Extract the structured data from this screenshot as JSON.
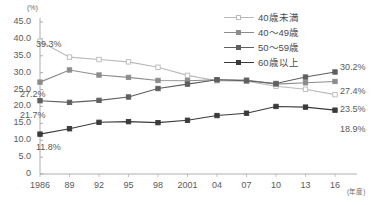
{
  "chart_data": {
    "type": "line",
    "title": "",
    "subtitle": "",
    "xlabel": "(年度)",
    "ylabel": "(%)",
    "x": [
      1986,
      1989,
      1992,
      1995,
      1998,
      2001,
      2004,
      2007,
      2010,
      2013,
      2016
    ],
    "categories": [
      "1986",
      "89",
      "92",
      "95",
      "98",
      "2001",
      "04",
      "07",
      "10",
      "13",
      "16"
    ],
    "ylim": [
      0,
      45
    ],
    "yticks": [
      0,
      5,
      10,
      15,
      20,
      25,
      30,
      35,
      40,
      45
    ],
    "ytick_labels": [
      "0",
      "5.0",
      "10.0",
      "15.0",
      "20.0",
      "25.0",
      "30.0",
      "35.0",
      "40.0",
      "45.0"
    ],
    "grid": false,
    "legend_position": "top-right",
    "series": [
      {
        "name": "40歳未満",
        "color": "#b9b9b9",
        "marker": "open-square",
        "values": [
          39.3,
          34.6,
          33.9,
          33.2,
          31.6,
          29.2,
          27.6,
          27.5,
          26.0,
          25.1,
          23.5
        ],
        "start_label": "39.3%",
        "end_label": "23.5%"
      },
      {
        "name": "40～49歳",
        "color": "#8c8c8c",
        "marker": "filled-square",
        "values": [
          27.2,
          30.8,
          29.3,
          28.6,
          27.7,
          27.6,
          27.9,
          27.8,
          26.6,
          27.0,
          27.4
        ],
        "start_label": "27.2%",
        "end_label": "27.4%"
      },
      {
        "name": "50～59歳",
        "color": "#5f5f5f",
        "marker": "filled-square",
        "values": [
          21.7,
          21.2,
          21.8,
          22.8,
          25.3,
          26.6,
          27.9,
          27.6,
          26.8,
          28.7,
          30.2
        ],
        "start_label": "21.7%",
        "end_label": "30.2%"
      },
      {
        "name": "60歳以上",
        "color": "#3a3a3a",
        "marker": "filled-square",
        "values": [
          11.8,
          13.4,
          15.3,
          15.5,
          15.2,
          15.9,
          17.3,
          18.0,
          20.0,
          19.8,
          18.9
        ],
        "start_label": "11.8%",
        "end_label": "18.9%"
      }
    ],
    "point_labels": [
      {
        "text": "39.3%",
        "x": 36,
        "y": 39
      },
      {
        "text": "27.2%",
        "x": 20,
        "y": 89
      },
      {
        "text": "21.7%",
        "x": 20,
        "y": 110
      },
      {
        "text": "11.8%",
        "x": 36,
        "y": 142
      },
      {
        "text": "30.2%",
        "x": 340,
        "y": 62
      },
      {
        "text": "27.4%",
        "x": 340,
        "y": 86
      },
      {
        "text": "23.5%",
        "x": 340,
        "y": 104
      },
      {
        "text": "18.9%",
        "x": 340,
        "y": 124
      }
    ]
  },
  "axes": {
    "unit": "(%)",
    "x_axis_title": "(年度)"
  }
}
